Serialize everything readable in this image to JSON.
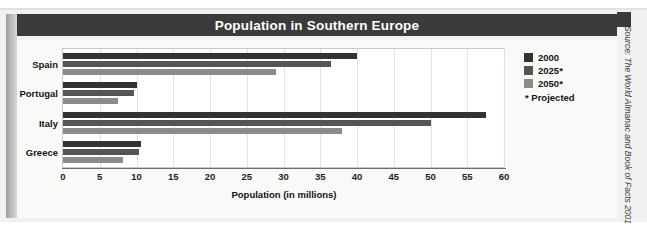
{
  "header": {
    "title": "Population in Southern Europe"
  },
  "legend": {
    "items": [
      {
        "label": "2000",
        "color": "#333333"
      },
      {
        "label": "2025*",
        "color": "#555555"
      },
      {
        "label": "2050*",
        "color": "#8b8b8b"
      }
    ],
    "note": "* Projected"
  },
  "axis": {
    "x_title": "Population (in millions)",
    "tick_labels": [
      "0",
      "5",
      "10",
      "15",
      "20",
      "25",
      "30",
      "35",
      "40",
      "45",
      "50",
      "55",
      "60"
    ]
  },
  "source": {
    "text": "Source: The World Almanac and Book of Facts 2001"
  },
  "chart_data": {
    "type": "bar",
    "orientation": "horizontal",
    "title": "Population in Southern Europe",
    "xlabel": "Population (in millions)",
    "ylabel": "",
    "xlim": [
      0,
      60
    ],
    "xticks": [
      0,
      5,
      10,
      15,
      20,
      25,
      30,
      35,
      40,
      45,
      50,
      55,
      60
    ],
    "grid": true,
    "legend_position": "top-right",
    "categories": [
      "Spain",
      "Portugal",
      "Italy",
      "Greece"
    ],
    "series": [
      {
        "name": "2000",
        "color": "#333333",
        "values": [
          40.0,
          10.0,
          57.5,
          10.6
        ]
      },
      {
        "name": "2025*",
        "color": "#555555",
        "values": [
          36.5,
          9.7,
          50.0,
          10.3
        ]
      },
      {
        "name": "2050*",
        "color": "#8b8b8b",
        "values": [
          29.0,
          7.5,
          38.0,
          8.2
        ]
      }
    ],
    "annotations": [
      "* Projected"
    ],
    "source": "Source: The World Almanac and Book of Facts 2001"
  }
}
